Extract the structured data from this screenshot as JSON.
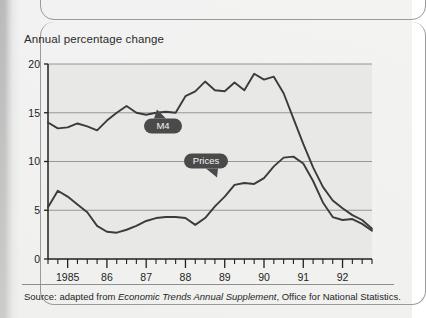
{
  "figure": {
    "title": "Annual percentage change",
    "source_prefix": "Source: adapted from ",
    "source_italic": "Economic Trends Annual Supplement",
    "source_suffix": ", Office for National Statistics."
  },
  "callouts": {
    "m4": "M4",
    "prices": "Prices"
  },
  "chart_data": {
    "type": "line",
    "title": "Annual percentage change",
    "xlabel": "",
    "ylabel": "Annual percentage change",
    "ylim": [
      0,
      20
    ],
    "yticks": [
      0,
      5,
      10,
      15,
      20
    ],
    "ytick_labels": [
      "0",
      "5",
      "10",
      "15",
      "20"
    ],
    "xlim": [
      1984.5,
      1992.75
    ],
    "xtick_labels": [
      "1985",
      "86",
      "87",
      "88",
      "89",
      "90",
      "91",
      "92"
    ],
    "xtick_values": [
      1985,
      1986,
      1987,
      1988,
      1989,
      1990,
      1991,
      1992
    ],
    "minor_tick_interval": 0.25,
    "grid": "horizontal",
    "legend_position": "inline-callouts",
    "line_color": "#3b3b3b",
    "plot_background": "#e8e8e6",
    "series": [
      {
        "name": "M4",
        "x": [
          1984.5,
          1984.75,
          1985.0,
          1985.25,
          1985.5,
          1985.75,
          1986.0,
          1986.25,
          1986.5,
          1986.75,
          1987.0,
          1987.25,
          1987.5,
          1987.75,
          1988.0,
          1988.25,
          1988.5,
          1988.75,
          1989.0,
          1989.25,
          1989.5,
          1989.75,
          1990.0,
          1990.25,
          1990.5,
          1990.75,
          1991.0,
          1991.25,
          1991.5,
          1991.75,
          1992.0,
          1992.25,
          1992.5,
          1992.75
        ],
        "values": [
          14.0,
          13.4,
          13.5,
          13.9,
          13.6,
          13.2,
          14.2,
          15.0,
          15.7,
          15.0,
          14.8,
          15.0,
          15.1,
          15.0,
          16.7,
          17.2,
          18.2,
          17.3,
          17.2,
          18.1,
          17.3,
          19.0,
          18.4,
          18.7,
          17.0,
          14.4,
          11.8,
          9.4,
          7.4,
          6.0,
          5.2,
          4.5,
          4.0,
          3.1
        ]
      },
      {
        "name": "Prices",
        "x": [
          1984.5,
          1984.75,
          1985.0,
          1985.25,
          1985.5,
          1985.75,
          1986.0,
          1986.25,
          1986.5,
          1986.75,
          1987.0,
          1987.25,
          1987.5,
          1987.75,
          1988.0,
          1988.25,
          1988.5,
          1988.75,
          1989.0,
          1989.25,
          1989.5,
          1989.75,
          1990.0,
          1990.25,
          1990.5,
          1990.75,
          1991.0,
          1991.25,
          1991.5,
          1991.75,
          1992.0,
          1992.25,
          1992.5,
          1992.75
        ],
        "values": [
          5.3,
          7.0,
          6.4,
          5.6,
          4.8,
          3.4,
          2.8,
          2.7,
          3.0,
          3.4,
          3.9,
          4.2,
          4.3,
          4.3,
          4.2,
          3.5,
          4.2,
          5.4,
          6.4,
          7.6,
          7.8,
          7.7,
          8.3,
          9.5,
          10.4,
          10.5,
          9.8,
          8.0,
          5.8,
          4.3,
          4.0,
          4.1,
          3.6,
          2.9
        ]
      }
    ]
  }
}
